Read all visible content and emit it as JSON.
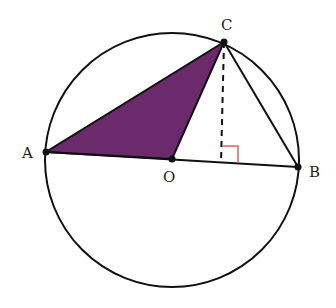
{
  "diagram": {
    "colors": {
      "fill": "#6b2a6b",
      "stroke": "#111111",
      "right_angle": "#e06060"
    },
    "points": {
      "A": {
        "label": "A",
        "x": 46,
        "y": 152
      },
      "O": {
        "label": "O",
        "x": 172,
        "y": 159
      },
      "B": {
        "label": "B",
        "x": 298,
        "y": 167
      },
      "C": {
        "label": "C",
        "x": 224,
        "y": 42
      }
    },
    "circle": {
      "cx": 172,
      "cy": 160,
      "r": 127
    },
    "altitude_foot": {
      "x": 221,
      "y": 163
    }
  }
}
